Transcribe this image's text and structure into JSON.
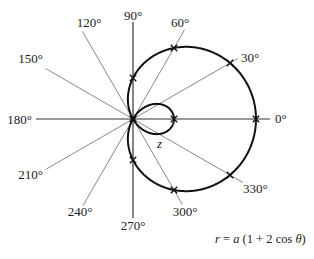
{
  "diagram": {
    "equation": {
      "r": "r",
      "eq": " = ",
      "a": "a",
      "rest": " (1 + 2 cos ",
      "theta": "θ",
      "close": ")"
    },
    "curve": {
      "kind": "polar",
      "formula": "r = a(1 + 2 cos θ)",
      "b_over_a": 2
    },
    "point_label": "z",
    "angle_labels": [
      {
        "deg": 0,
        "text": "0°"
      },
      {
        "deg": 30,
        "text": "30°"
      },
      {
        "deg": 60,
        "text": "60°"
      },
      {
        "deg": 90,
        "text": "90°"
      },
      {
        "deg": 120,
        "text": "120°"
      },
      {
        "deg": 150,
        "text": "150°"
      },
      {
        "deg": 180,
        "text": "180°"
      },
      {
        "deg": 210,
        "text": "210°"
      },
      {
        "deg": 240,
        "text": "240°"
      },
      {
        "deg": 270,
        "text": "270°"
      },
      {
        "deg": 300,
        "text": "300°"
      },
      {
        "deg": 330,
        "text": "330°"
      }
    ],
    "marked_points_deg": [
      0,
      30,
      60,
      90,
      120,
      180,
      240,
      270,
      300,
      330
    ],
    "colors": {
      "curve": "#111111",
      "rays": "#555555",
      "axes": "#333333",
      "text": "#222222"
    }
  }
}
